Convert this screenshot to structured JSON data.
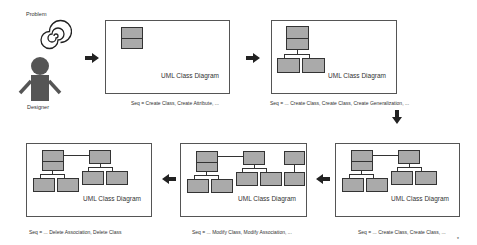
{
  "actors": {
    "problem_label": "Problem",
    "designer_label": "Designer"
  },
  "frames": [
    {
      "title": "UML Class Diagram",
      "caption": "Seq = Create Class, Create Attribute, ..."
    },
    {
      "title": "UML Class Diagram",
      "caption": "Seq = ... Create Class, Create Class, Create Generalization, ..."
    },
    {
      "title": "UML Class Diagram",
      "caption": "Seq = ... Create Class, Create Class, ..."
    },
    {
      "title": "UML Class Diagram",
      "caption": "Seq = ... Modify Class, Modify Association, ..."
    },
    {
      "title": "UML Class Diagram",
      "caption": "Seq = ... Delete Association, Delete Class"
    }
  ],
  "colors": {
    "class_fill": "#aaaaaa",
    "stroke": "#333333",
    "arrow": "#222222"
  },
  "footer_mark": "*"
}
